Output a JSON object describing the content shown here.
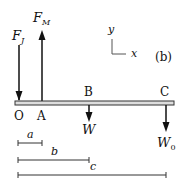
{
  "diagram": {
    "panel_label": "(b)",
    "axes": {
      "y_label": "y",
      "x_label": "x"
    },
    "beam": {
      "x1": 15,
      "x2": 174,
      "y_top": 101,
      "height": 4
    },
    "points": [
      {
        "id": "O",
        "label": "O",
        "x": 19
      },
      {
        "id": "A",
        "label": "A",
        "x": 42
      },
      {
        "id": "B",
        "label": "B",
        "x": 89
      },
      {
        "id": "C",
        "label": "C",
        "x": 166
      }
    ],
    "forces": [
      {
        "id": "FJ",
        "label": "F",
        "sub": "J",
        "at": "O",
        "direction": "down"
      },
      {
        "id": "FM",
        "label": "F",
        "sub": "M",
        "at": "A",
        "direction": "up"
      },
      {
        "id": "W",
        "label": "W",
        "sub": "",
        "at": "B",
        "direction": "down"
      },
      {
        "id": "W0",
        "label": "W",
        "sub": "0",
        "at": "C",
        "direction": "down"
      }
    ],
    "dimensions": [
      {
        "id": "a",
        "label": "a",
        "from": "O",
        "to": "A"
      },
      {
        "id": "b",
        "label": "b",
        "from": "O",
        "to": "B"
      },
      {
        "id": "c",
        "label": "c",
        "from": "O",
        "to": "C"
      }
    ]
  }
}
